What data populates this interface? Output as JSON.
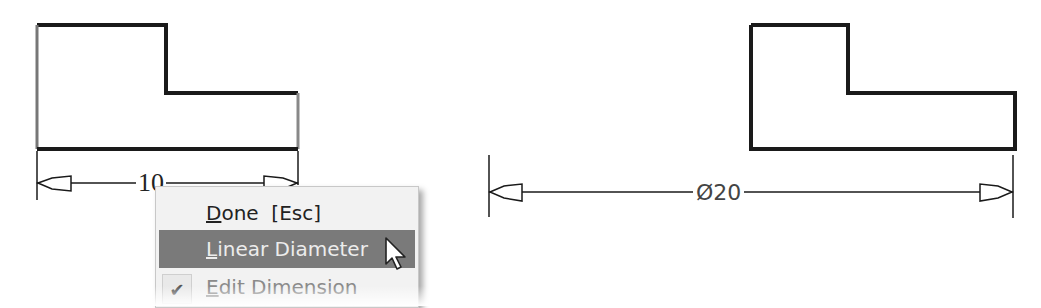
{
  "left_drawing": {
    "dimension_value": "10"
  },
  "right_drawing": {
    "dimension_value": "Ø20"
  },
  "context_menu": {
    "items": [
      {
        "label": "Done  [Esc]",
        "mnemonic": "D",
        "rest": "one  [Esc]",
        "state": "normal"
      },
      {
        "label": "Linear Diameter",
        "mnemonic": "L",
        "rest": "inear Diameter",
        "state": "highlighted"
      },
      {
        "label": "Edit Dimension",
        "mnemonic": "E",
        "rest": "dit Dimension",
        "state": "checked-disabled"
      }
    ],
    "check_icon": "✔"
  },
  "colors": {
    "line": "#1a1a1a",
    "highlight": "#7a7a7a",
    "menu_bg": "#f2f2f2"
  }
}
